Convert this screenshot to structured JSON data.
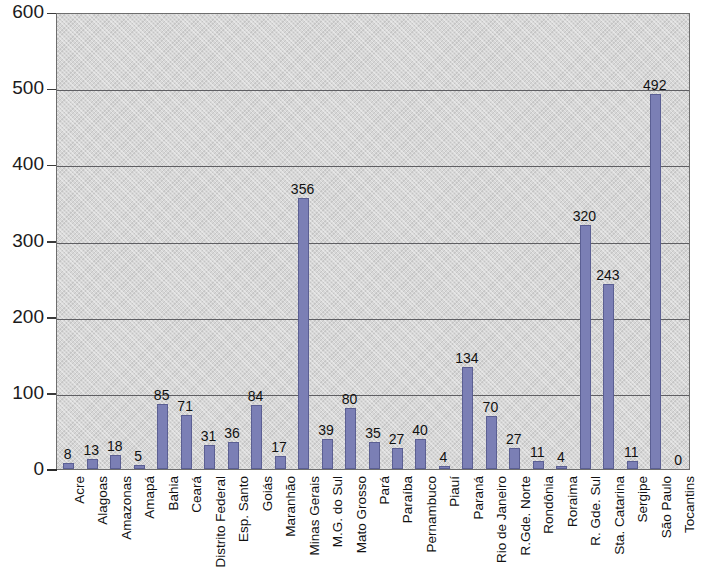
{
  "chart_data": {
    "type": "bar",
    "title": "",
    "subtitle": "",
    "xlabel": "",
    "ylabel": "",
    "ylim": [
      0,
      600
    ],
    "ytick_values": [
      0,
      100,
      200,
      300,
      400,
      500,
      600
    ],
    "ytick_labels": [
      "0",
      "100",
      "200",
      "300",
      "400",
      "500",
      "600"
    ],
    "grid": true,
    "grid_axis": "y",
    "legend": false,
    "legend_position": "none",
    "bar_color": "#7b7fb5",
    "bar_edge_color": "#5b5f93",
    "plot_background": "#d7d7d7",
    "data_labels": true,
    "categories": [
      "Acre",
      "Alagoas",
      "Amazonas",
      "Amapá",
      "Bahia",
      "Ceará",
      "Distrito Federal",
      "Esp. Santo",
      "Goiás",
      "Maranhão",
      "Minas Gerais",
      "M.G. do Sul",
      "Mato Grosso",
      "Pará",
      "Paraíba",
      "Pernambuco",
      "Piauí",
      "Paraná",
      "Rio de Janeiro",
      "R.Gde. Norte",
      "Rondônia",
      "Roraima",
      "R. Gde. Sul",
      "Sta. Catarina",
      "Sergipe",
      "São Paulo",
      "Tocantins"
    ],
    "values": [
      8,
      13,
      18,
      5,
      85,
      71,
      31,
      36,
      84,
      17,
      356,
      39,
      80,
      35,
      27,
      40,
      4,
      134,
      70,
      27,
      11,
      4,
      320,
      243,
      11,
      492,
      0
    ],
    "value_labels": [
      "8",
      "13",
      "18",
      "5",
      "85",
      "71",
      "31",
      "36",
      "84",
      "17",
      "356",
      "39",
      "80",
      "35",
      "27",
      "40",
      "4",
      "134",
      "70",
      "27",
      "11",
      "4",
      "320",
      "243",
      "11",
      "492",
      "0"
    ]
  }
}
